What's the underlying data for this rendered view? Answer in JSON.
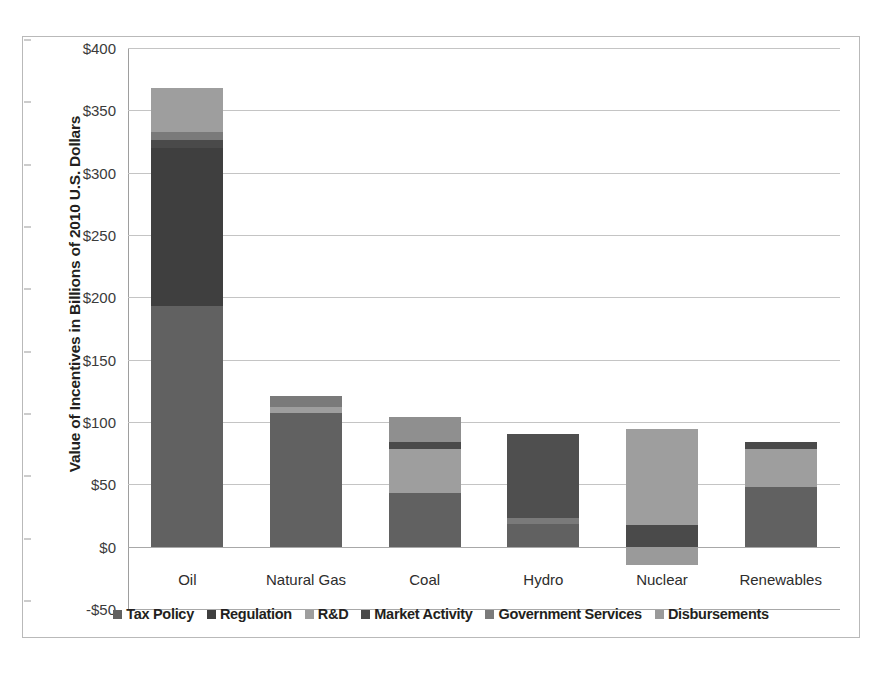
{
  "chart_data": {
    "type": "bar",
    "subtype": "stacked-bar-with-negative",
    "title": "",
    "xlabel": "",
    "ylabel": "Value of Incentives in Billions of 2010 U.S. Dollars",
    "ylim": [
      -50,
      400
    ],
    "ytick_values": [
      400,
      350,
      300,
      250,
      200,
      150,
      100,
      50,
      0,
      -50
    ],
    "ytick_labels": [
      "$400",
      "$350",
      "$300",
      "$250",
      "$200",
      "$150",
      "$100",
      "$50",
      "$0",
      "-$50"
    ],
    "grid": true,
    "legend_position": "bottom",
    "categories": [
      "Oil",
      "Natural Gas",
      "Coal",
      "Hydro",
      "Nuclear",
      "Renewables"
    ],
    "series": [
      {
        "name": "Tax Policy",
        "color": "#616161",
        "values": [
          193,
          107,
          43,
          18,
          0,
          48
        ]
      },
      {
        "name": "Regulation",
        "color": "#3f3f3f",
        "values": [
          127,
          0,
          0,
          67,
          0,
          0
        ]
      },
      {
        "name": "R&D",
        "color": "#9e9e9e",
        "values": [
          35,
          5,
          35,
          0,
          77,
          30
        ]
      },
      {
        "name": "Market Activity",
        "color": "#4a4a4a",
        "values": [
          6,
          0,
          6,
          0,
          17,
          6
        ]
      },
      {
        "name": "Government Services",
        "color": "#7a7a7a",
        "values": [
          7,
          9,
          20,
          5,
          0,
          0
        ]
      },
      {
        "name": "Disbursements",
        "color": "#9a9a9a",
        "values": [
          0,
          0,
          0,
          0,
          -15,
          0
        ]
      }
    ],
    "totals": [
      368,
      121,
      104,
      90,
      94,
      84
    ],
    "stacks": [
      {
        "category": "Oil",
        "top": 368,
        "bottom": 0,
        "segments": [
          {
            "label": "Tax Policy",
            "from": 0,
            "to": 193,
            "color": "#616161"
          },
          {
            "label": "Regulation",
            "from": 193,
            "to": 320,
            "color": "#3f3f3f"
          },
          {
            "label": "Market Activity",
            "from": 320,
            "to": 326,
            "color": "#4a4a4a"
          },
          {
            "label": "Government Services",
            "from": 326,
            "to": 333,
            "color": "#7a7a7a"
          },
          {
            "label": "R&D",
            "from": 333,
            "to": 368,
            "color": "#9e9e9e"
          }
        ]
      },
      {
        "category": "Natural Gas",
        "top": 121,
        "bottom": 0,
        "segments": [
          {
            "label": "Tax Policy",
            "from": 0,
            "to": 107,
            "color": "#616161"
          },
          {
            "label": "R&D",
            "from": 107,
            "to": 112,
            "color": "#9e9e9e"
          },
          {
            "label": "Government Services",
            "from": 112,
            "to": 121,
            "color": "#7a7a7a"
          }
        ]
      },
      {
        "category": "Coal",
        "top": 104,
        "bottom": 0,
        "segments": [
          {
            "label": "Tax Policy",
            "from": 0,
            "to": 43,
            "color": "#616161"
          },
          {
            "label": "R&D",
            "from": 43,
            "to": 78,
            "color": "#9e9e9e"
          },
          {
            "label": "Market Activity",
            "from": 78,
            "to": 84,
            "color": "#4a4a4a"
          },
          {
            "label": "Government Services",
            "from": 84,
            "to": 104,
            "color": "#8f8f8f"
          }
        ]
      },
      {
        "category": "Hydro",
        "top": 90,
        "bottom": 0,
        "segments": [
          {
            "label": "Tax Policy",
            "from": 0,
            "to": 18,
            "color": "#616161"
          },
          {
            "label": "Government Services",
            "from": 18,
            "to": 23,
            "color": "#7a7a7a"
          },
          {
            "label": "Regulation",
            "from": 23,
            "to": 90,
            "color": "#4f4f4f"
          }
        ]
      },
      {
        "category": "Nuclear",
        "top": 94,
        "bottom": -15,
        "segments": [
          {
            "label": "Disbursements",
            "from": -15,
            "to": 0,
            "color": "#9a9a9a"
          },
          {
            "label": "Market Activity",
            "from": 0,
            "to": 17,
            "color": "#4a4a4a"
          },
          {
            "label": "R&D",
            "from": 17,
            "to": 94,
            "color": "#9e9e9e"
          }
        ]
      },
      {
        "category": "Renewables",
        "top": 84,
        "bottom": 0,
        "segments": [
          {
            "label": "Tax Policy",
            "from": 0,
            "to": 48,
            "color": "#616161"
          },
          {
            "label": "R&D",
            "from": 48,
            "to": 78,
            "color": "#9e9e9e"
          },
          {
            "label": "Market Activity",
            "from": 78,
            "to": 84,
            "color": "#4a4a4a"
          }
        ]
      }
    ],
    "legend": [
      {
        "label": "Tax Policy",
        "color": "#616161"
      },
      {
        "label": "Regulation",
        "color": "#3f3f3f"
      },
      {
        "label": "R&D",
        "color": "#9e9e9e"
      },
      {
        "label": "Market Activity",
        "color": "#4a4a4a"
      },
      {
        "label": "Government Services",
        "color": "#7a7a7a"
      },
      {
        "label": "Disbursements",
        "color": "#9a9a9a"
      }
    ]
  }
}
